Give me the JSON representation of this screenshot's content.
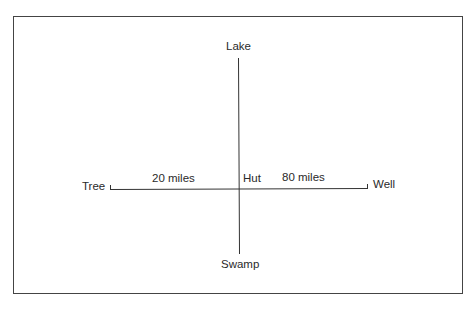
{
  "diagram": {
    "points": {
      "top": "Lake",
      "bottom": "Swamp",
      "left": "Tree",
      "right": "Well",
      "center": "Hut"
    },
    "distances": {
      "tree_to_hut": "20 miles",
      "hut_to_well": "80 miles"
    }
  }
}
